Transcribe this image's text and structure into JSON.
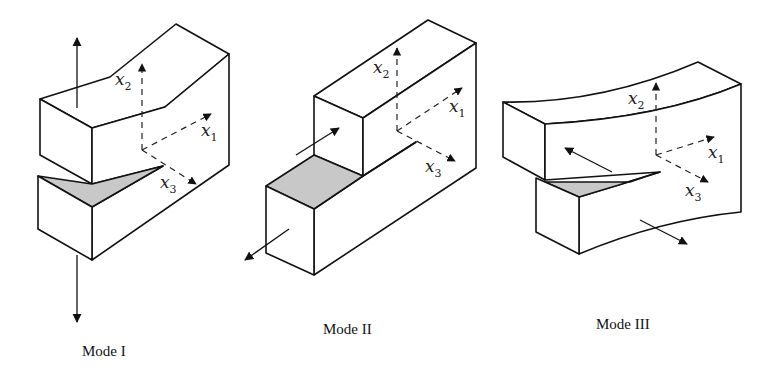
{
  "figure": {
    "colors": {
      "line": "#111111",
      "crack_face_shading": "#c8c8c8",
      "background": "#ffffff"
    },
    "panels": [
      {
        "id": "mode-1",
        "caption": "Mode I",
        "loading": "opening (tensile, along x2)",
        "axes": [
          {
            "name": "x",
            "sub": "2"
          },
          {
            "name": "x",
            "sub": "1"
          },
          {
            "name": "x",
            "sub": "3"
          }
        ]
      },
      {
        "id": "mode-2",
        "caption": "Mode II",
        "loading": "in-plane sliding (along x1)",
        "axes": [
          {
            "name": "x",
            "sub": "2"
          },
          {
            "name": "x",
            "sub": "1"
          },
          {
            "name": "x",
            "sub": "3"
          }
        ]
      },
      {
        "id": "mode-3",
        "caption": "Mode III",
        "loading": "out-of-plane tearing (along x3)",
        "axes": [
          {
            "name": "x",
            "sub": "2"
          },
          {
            "name": "x",
            "sub": "1"
          },
          {
            "name": "x",
            "sub": "3"
          }
        ]
      }
    ]
  }
}
